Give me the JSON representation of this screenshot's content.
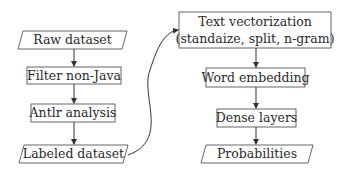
{
  "diagram": {
    "left_column": [
      {
        "id": "raw",
        "label": "Raw dataset",
        "shape": "parallelogram"
      },
      {
        "id": "filter",
        "label": "Filter non-Java",
        "shape": "rectangle"
      },
      {
        "id": "antlr",
        "label": "Antlr analysis",
        "shape": "rectangle"
      },
      {
        "id": "labeled",
        "label": "Labeled dataset",
        "shape": "parallelogram"
      }
    ],
    "right_column": [
      {
        "id": "vectorize",
        "label_line1": "Text vectorization",
        "label_line2": "(standaize, split, n-gram)",
        "shape": "rectangle"
      },
      {
        "id": "embedding",
        "label": "Word embedding",
        "shape": "rectangle"
      },
      {
        "id": "dense",
        "label": "Dense layers",
        "shape": "rectangle"
      },
      {
        "id": "probs",
        "label": "Probabilities",
        "shape": "parallelogram"
      }
    ],
    "edges": [
      [
        "raw",
        "filter"
      ],
      [
        "filter",
        "antlr"
      ],
      [
        "antlr",
        "labeled"
      ],
      [
        "labeled",
        "vectorize"
      ],
      [
        "vectorize",
        "embedding"
      ],
      [
        "embedding",
        "dense"
      ],
      [
        "dense",
        "probs"
      ]
    ],
    "colors": {
      "stroke": "#444444",
      "text": "#2a2a2a",
      "background": "#ffffff"
    }
  }
}
